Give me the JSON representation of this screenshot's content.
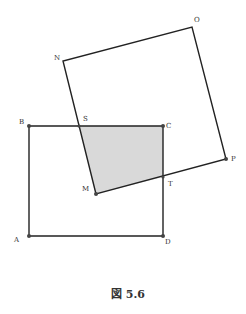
{
  "figure": {
    "caption": "図 5.6",
    "shaded_region_color": "#d9d9d9",
    "line_color": "#222222"
  },
  "points": {
    "A": {
      "label": "A",
      "x": 29,
      "y": 236
    },
    "B": {
      "label": "B",
      "x": 29,
      "y": 126
    },
    "C": {
      "label": "C",
      "x": 163,
      "y": 126
    },
    "D": {
      "label": "D",
      "x": 163,
      "y": 236
    },
    "M": {
      "label": "M",
      "x": 96,
      "y": 194
    },
    "N": {
      "label": "N",
      "x": 63,
      "y": 61
    },
    "O": {
      "label": "O",
      "x": 192,
      "y": 27
    },
    "P": {
      "label": "P",
      "x": 226,
      "y": 159
    },
    "S": {
      "label": "S",
      "x": 79,
      "y": 126
    },
    "T": {
      "label": "T",
      "x": 163,
      "y": 177
    }
  },
  "shapes": {
    "square_ABCD": [
      "A",
      "B",
      "C",
      "D"
    ],
    "square_MNOP": [
      "M",
      "N",
      "O",
      "P"
    ],
    "shaded_quadrilateral": [
      "S",
      "C",
      "T",
      "M"
    ]
  }
}
